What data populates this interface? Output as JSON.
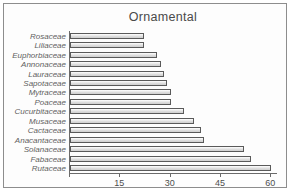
{
  "chart_data": {
    "type": "bar",
    "orientation": "horizontal",
    "title": "Ornamental",
    "xlabel": "",
    "ylabel": "",
    "categories": [
      "Rosaceae",
      "Liliaceae",
      "Euphorbiaceae",
      "Annonaceae",
      "Lauraceae",
      "Sapotaceae",
      "Mytraceae",
      "Poaceae",
      "Cucurbitaceae",
      "Musaceae",
      "Cactaceae",
      "Anacantaceae",
      "Solanaceae",
      "Fabaceae",
      "Rutaceae"
    ],
    "values": [
      22,
      22,
      26,
      27,
      28,
      29,
      30,
      30,
      34,
      37,
      39,
      40,
      52,
      54,
      60
    ],
    "xlim": [
      0,
      62
    ],
    "xticks": [
      15,
      30,
      45,
      60
    ],
    "xticklabels": [
      "15",
      "30",
      "45",
      "60"
    ],
    "grid": false,
    "legend": false
  },
  "style": {
    "bar_fill": "#dcdcdc",
    "bar_stroke": "#5a5a5a",
    "axis_color": "#6a6a6a",
    "frame_color": "#8d8d8d",
    "text_color": "#5f5f5f",
    "background": "#fdfdfd"
  }
}
